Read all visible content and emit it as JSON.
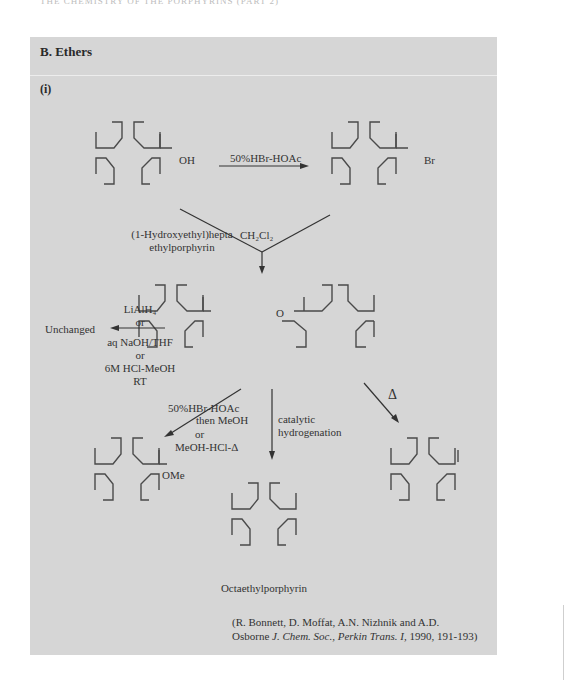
{
  "page": {
    "running_head": "THE CHEMISTRY OF THE PORPHYRINS (PART 2)",
    "section_heading": "B. Ethers",
    "subsection": "(i)"
  },
  "scheme": {
    "reagent_top": "50%HBr-HOAc",
    "substituent_oh": "OH",
    "substituent_br": "Br",
    "substituent_o": "O",
    "substituent_ome": "OMe",
    "start_name_line1": "(1-Hydroxyethyl)hepta",
    "start_name_line2": "ethylporphyrin",
    "solvent": "CH₂Cl₂",
    "left_conditions": [
      "LiAlH₄",
      "or",
      "aq NaOH/THF",
      "or",
      "6M  HCl-MeOH",
      "RT"
    ],
    "left_result": "Unchanged",
    "methanolysis_conditions": [
      "50%HBr-HOAc",
      "then MeOH",
      "or",
      "MeOH-HCl-Δ"
    ],
    "hydrogenation_conditions": [
      "catalytic",
      "hydrogenation"
    ],
    "heat_label": "Δ",
    "product_name": "Octaethylporphyrin"
  },
  "reference": {
    "line1": "(R. Bonnett, D. Moffat, A.N. Nizhnik and A.D.",
    "line2_prefix": "Osborne ",
    "journal": "J. Chem. Soc., Perkin Trans. I,",
    "details": " 1990, 191-193)"
  },
  "colors": {
    "panel": "#d6d6d6",
    "ink": "#333333"
  }
}
